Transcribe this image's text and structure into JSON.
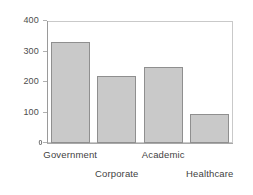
{
  "chart_data": {
    "type": "bar",
    "title": "",
    "xlabel": "",
    "ylabel": "",
    "categories": [
      "Government",
      "Corporate",
      "Academic",
      "Healthcare"
    ],
    "values": [
      330,
      220,
      250,
      95
    ],
    "ylim": [
      0,
      400
    ],
    "yticks": [
      0,
      100,
      200,
      300,
      400
    ],
    "ytick_labels": [
      "0",
      "100",
      "200",
      "300",
      "400"
    ],
    "grid": false,
    "legend": false,
    "bar_color": "#c9c9c9",
    "bar_edge_color": "#8f8f8f",
    "frame_color": "#c9c9c9",
    "axis_color": "#9a9a9a",
    "label_rows": [
      0,
      1,
      0,
      1
    ],
    "baseline_tick_label_note": "illegible smudged zero label"
  },
  "axis": {
    "y": {
      "ticks": [
        {
          "label": "400",
          "value": 400
        },
        {
          "label": "300",
          "value": 300
        },
        {
          "label": "200",
          "value": 200
        },
        {
          "label": "100",
          "value": 100
        },
        {
          "label": "0",
          "value": 0
        }
      ]
    },
    "x": {
      "labels": [
        "Government",
        "Corporate",
        "Academic",
        "Healthcare"
      ]
    }
  }
}
